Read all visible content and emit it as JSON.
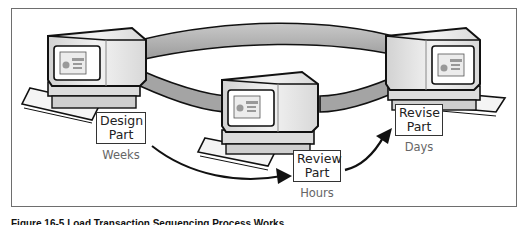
{
  "figure": {
    "caption": "Figure 16-5  Load Transaction Sequencing Process Works",
    "nodes": [
      {
        "id": "design",
        "label_line1": "Design",
        "label_line2": "Part",
        "duration": "Weeks"
      },
      {
        "id": "review",
        "label_line1": "Review",
        "label_line2": "Part",
        "duration": "Hours"
      },
      {
        "id": "revise",
        "label_line1": "Revise",
        "label_line2": "Part",
        "duration": "Days"
      }
    ],
    "connections": [
      {
        "from": "design",
        "to": "review",
        "type": "arrow"
      },
      {
        "from": "review",
        "to": "revise",
        "type": "arrow"
      },
      {
        "type": "ring",
        "description": "network ring linking all three computers"
      }
    ],
    "colors": {
      "frame": "#6e6e6e",
      "ring": "#a9a9a9",
      "computer_body": "#e6e6e6",
      "outline": "#111111",
      "duration_text": "#666666"
    }
  }
}
